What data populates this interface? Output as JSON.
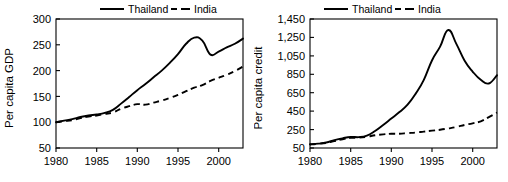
{
  "figure": {
    "panel_count": 2,
    "background_color": "#ffffff",
    "line_color": "#000000"
  },
  "chart_data": [
    {
      "id": "per-capita-gdp",
      "type": "line",
      "title": "",
      "xlabel": "",
      "ylabel": "Per capita GDP",
      "xlim": [
        1980,
        2003
      ],
      "ylim": [
        50,
        300
      ],
      "xticks": [
        1980,
        1985,
        1990,
        1995,
        2000
      ],
      "xtick_labels": [
        "1980",
        "1985",
        "1990",
        "1995",
        "2000"
      ],
      "yticks": [
        50,
        100,
        150,
        200,
        250,
        300
      ],
      "ytick_labels": [
        "50",
        "100",
        "150",
        "200",
        "250",
        "300"
      ],
      "grid": false,
      "legend_position": "top",
      "x": [
        1980,
        1981,
        1982,
        1983,
        1984,
        1985,
        1986,
        1987,
        1988,
        1989,
        1990,
        1991,
        1992,
        1993,
        1994,
        1995,
        1996,
        1997,
        1998,
        1999,
        2000,
        2001,
        2002,
        2003
      ],
      "series": [
        {
          "name": "Thailand",
          "style": "solid",
          "values": [
            100,
            103,
            106,
            110,
            113,
            115,
            118,
            124,
            136,
            149,
            162,
            174,
            187,
            200,
            215,
            232,
            252,
            264,
            258,
            231,
            237,
            245,
            252,
            262
          ]
        },
        {
          "name": "India",
          "style": "dashed",
          "values": [
            100,
            102,
            104,
            108,
            111,
            113,
            116,
            119,
            126,
            131,
            135,
            134,
            138,
            142,
            147,
            153,
            160,
            167,
            172,
            180,
            186,
            192,
            199,
            208
          ]
        }
      ]
    },
    {
      "id": "per-capita-credit",
      "type": "line",
      "title": "",
      "xlabel": "",
      "ylabel": "Per capita credit",
      "xlim": [
        1980,
        2003
      ],
      "ylim": [
        50,
        1450
      ],
      "xticks": [
        1980,
        1985,
        1990,
        1995,
        2000
      ],
      "xtick_labels": [
        "1980",
        "1985",
        "1990",
        "1995",
        "2000"
      ],
      "yticks": [
        50,
        250,
        450,
        650,
        850,
        1050,
        1250,
        1450
      ],
      "ytick_labels": [
        "50",
        "250",
        "450",
        "650",
        "850",
        "1,050",
        "1,250",
        "1,450"
      ],
      "grid": false,
      "legend_position": "top",
      "x": [
        1980,
        1981,
        1982,
        1983,
        1984,
        1985,
        1986,
        1987,
        1988,
        1989,
        1990,
        1991,
        1992,
        1993,
        1994,
        1995,
        1996,
        1997,
        1998,
        1999,
        2000,
        2001,
        2002,
        2003
      ],
      "series": [
        {
          "name": "Thailand",
          "style": "solid",
          "values": [
            90,
            98,
            110,
            135,
            155,
            170,
            168,
            185,
            235,
            300,
            370,
            440,
            520,
            640,
            790,
            1000,
            1150,
            1330,
            1180,
            1000,
            880,
            790,
            750,
            840
          ]
        },
        {
          "name": "India",
          "style": "dashed",
          "values": [
            88,
            95,
            105,
            125,
            145,
            160,
            162,
            172,
            188,
            198,
            205,
            205,
            212,
            218,
            228,
            238,
            248,
            262,
            278,
            300,
            318,
            340,
            385,
            435
          ]
        }
      ]
    }
  ],
  "legend": {
    "entries": [
      {
        "label": "Thailand",
        "style": "solid"
      },
      {
        "label": "India",
        "style": "dashed"
      }
    ]
  }
}
